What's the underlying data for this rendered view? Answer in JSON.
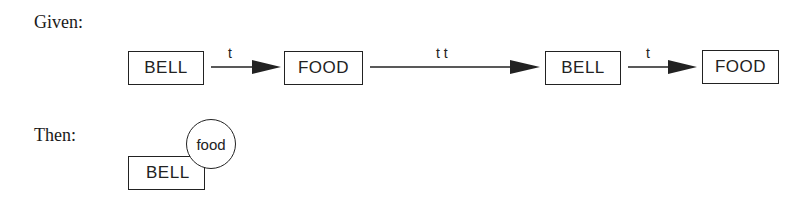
{
  "given": {
    "label": "Given:",
    "sequence": [
      {
        "type": "box",
        "text": "BELL"
      },
      {
        "type": "arrow",
        "label": "t"
      },
      {
        "type": "box",
        "text": "FOOD"
      },
      {
        "type": "arrow",
        "label": "t t"
      },
      {
        "type": "box",
        "text": "BELL"
      },
      {
        "type": "arrow",
        "label": "t"
      },
      {
        "type": "box",
        "text": "FOOD"
      }
    ]
  },
  "then": {
    "label": "Then:",
    "box_text": "BELL",
    "circle_text": "food"
  },
  "colors": {
    "stroke": "#222222",
    "background": "#ffffff"
  }
}
